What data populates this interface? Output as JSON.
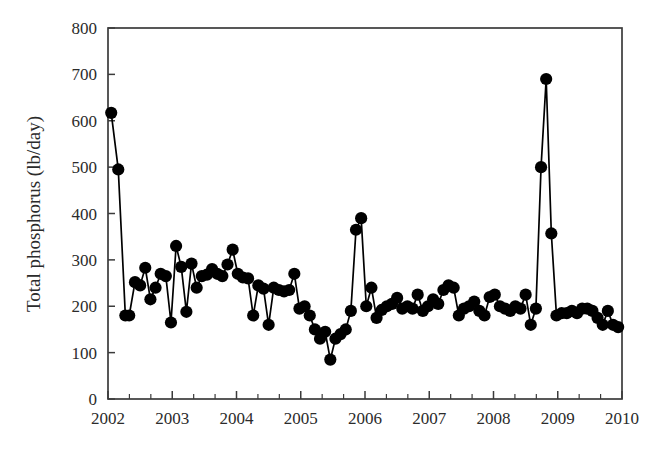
{
  "chart_data": {
    "type": "line",
    "title": "",
    "subtitle": "",
    "xlabel": "",
    "ylabel": "Total phosphorus (lb/day)",
    "xlim": [
      2002,
      2010
    ],
    "ylim": [
      0,
      800
    ],
    "y_ticks": [
      0,
      100,
      200,
      300,
      400,
      500,
      600,
      700,
      800
    ],
    "y_tick_labels": [
      "0",
      "100",
      "200",
      "300",
      "400",
      "500",
      "600",
      "700",
      "800"
    ],
    "x_ticks": [
      2002,
      2003,
      2004,
      2005,
      2006,
      2007,
      2008,
      2009,
      2010
    ],
    "x_tick_labels": [
      "2002",
      "2003",
      "2004",
      "2005",
      "2006",
      "2007",
      "2008",
      "2009",
      "2010"
    ],
    "x_minor_ticks_per_interval": 2,
    "grid": false,
    "legend": null,
    "legend_position": "none",
    "marker": "filled-circle",
    "marker_size": 9,
    "line_color": "#000000",
    "marker_color": "#000000",
    "series": [
      {
        "name": "Total phosphorus",
        "x": [
          2002.05,
          2002.16,
          2002.27,
          2002.33,
          2002.42,
          2002.5,
          2002.58,
          2002.66,
          2002.74,
          2002.82,
          2002.9,
          2002.98,
          2003.06,
          2003.14,
          2003.22,
          2003.3,
          2003.38,
          2003.46,
          2003.54,
          2003.62,
          2003.7,
          2003.78,
          2003.86,
          2003.94,
          2004.02,
          2004.1,
          2004.18,
          2004.26,
          2004.34,
          2004.42,
          2004.5,
          2004.58,
          2004.66,
          2004.74,
          2004.82,
          2004.9,
          2004.98,
          2005.06,
          2005.14,
          2005.22,
          2005.3,
          2005.38,
          2005.46,
          2005.54,
          2005.62,
          2005.7,
          2005.78,
          2005.86,
          2005.94,
          2006.02,
          2006.1,
          2006.18,
          2006.26,
          2006.34,
          2006.42,
          2006.5,
          2006.58,
          2006.66,
          2006.74,
          2006.82,
          2006.9,
          2006.98,
          2007.06,
          2007.14,
          2007.22,
          2007.3,
          2007.38,
          2007.46,
          2007.54,
          2007.62,
          2007.7,
          2007.78,
          2007.86,
          2007.94,
          2008.02,
          2008.1,
          2008.18,
          2008.26,
          2008.34,
          2008.42,
          2008.5,
          2008.58,
          2008.66,
          2008.74,
          2008.82,
          2008.9,
          2008.98,
          2009.06,
          2009.14,
          2009.22,
          2009.3,
          2009.38,
          2009.46,
          2009.54,
          2009.62,
          2009.7,
          2009.78,
          2009.86,
          2009.94
        ],
        "values": [
          617,
          495,
          180,
          180,
          252,
          245,
          283,
          215,
          240,
          270,
          265,
          165,
          330,
          285,
          188,
          292,
          240,
          265,
          268,
          280,
          270,
          265,
          290,
          322,
          270,
          262,
          260,
          180,
          245,
          238,
          160,
          240,
          235,
          232,
          235,
          270,
          195,
          200,
          180,
          150,
          130,
          145,
          85,
          130,
          140,
          150,
          190,
          365,
          390,
          200,
          240,
          175,
          192,
          200,
          205,
          218,
          195,
          200,
          195,
          225,
          190,
          200,
          215,
          205,
          235,
          245,
          240,
          180,
          195,
          200,
          210,
          190,
          180,
          220,
          225,
          200,
          195,
          190,
          200,
          195,
          225,
          160,
          195,
          500,
          690,
          357,
          180,
          185,
          185,
          190,
          185,
          195,
          195,
          190,
          175,
          160,
          190,
          160,
          155
        ]
      }
    ]
  },
  "axis": {
    "y_label": "Total phosphorus (lb/day)"
  }
}
